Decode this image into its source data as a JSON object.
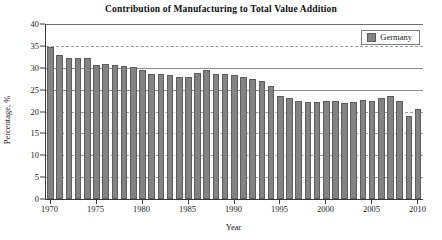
{
  "chart_data": {
    "type": "bar",
    "title": "Contribution of Manufacturing to Total Value Addition",
    "xlabel": "Year",
    "ylabel": "Percentage, %",
    "ylim": [
      0,
      40
    ],
    "ytick_step": 5,
    "yticks": [
      0,
      5,
      10,
      15,
      20,
      25,
      30,
      35,
      40
    ],
    "xlim": [
      1970,
      2010
    ],
    "xticks": [
      1970,
      1975,
      1980,
      1985,
      1990,
      1995,
      2000,
      2005,
      2010
    ],
    "grid": "horizontal-dashed",
    "legend": {
      "position": "top-right",
      "entries": [
        "Germany"
      ]
    },
    "series": [
      {
        "name": "Germany",
        "color": "#838383",
        "categories": [
          1970,
          1971,
          1972,
          1973,
          1974,
          1975,
          1976,
          1977,
          1978,
          1979,
          1980,
          1981,
          1982,
          1983,
          1984,
          1985,
          1986,
          1987,
          1988,
          1989,
          1990,
          1991,
          1992,
          1993,
          1994,
          1995,
          1996,
          1997,
          1998,
          1999,
          2000,
          2001,
          2002,
          2003,
          2004,
          2005,
          2006,
          2007,
          2008,
          2009,
          2010
        ],
        "values": [
          34.7,
          33.0,
          32.3,
          32.2,
          32.3,
          30.6,
          30.8,
          30.6,
          30.4,
          30.1,
          29.5,
          28.6,
          28.5,
          28.4,
          28.0,
          28.0,
          28.9,
          29.4,
          28.5,
          28.5,
          28.3,
          27.8,
          27.5,
          27.0,
          25.8,
          23.6,
          23.0,
          22.5,
          22.2,
          22.2,
          22.5,
          22.4,
          22.0,
          22.2,
          22.6,
          22.3,
          23.2,
          23.6,
          22.5,
          19.0,
          20.5
        ]
      }
    ]
  },
  "chart": {
    "title": "Contribution of Manufacturing to Total Value Addition",
    "x_axis_label": "Year",
    "y_axis_label": "Percentage, %",
    "legend_label": "Germany"
  }
}
